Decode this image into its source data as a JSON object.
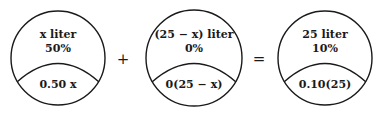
{
  "diagram": {
    "type": "mixture-equation",
    "containers": [
      {
        "volume_label": "x liter",
        "percent_label": "50%",
        "amount_label": "0.50 x"
      },
      {
        "volume_label": "(25 − x) liter",
        "percent_label": "0%",
        "amount_label": "0(25 − x)"
      },
      {
        "volume_label": "25 liter",
        "percent_label": "10%",
        "amount_label": "0.10(25)"
      }
    ],
    "operators": [
      "+",
      "="
    ],
    "colors": {
      "stroke": "#1a1a1a",
      "background": "#ffffff"
    }
  }
}
